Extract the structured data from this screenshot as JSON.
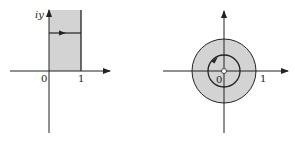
{
  "figures": [
    {
      "name": "strip-domain",
      "y_axis_label": "iy",
      "origin_label": "0",
      "tick_label": "1",
      "description": "Vertical half-strip 0 < Re z < 1, Im z > 0 shaded, with horizontal path arrow pointing right"
    },
    {
      "name": "annulus-image",
      "origin_label": "0",
      "tick_label": "1",
      "description": "Punctured unit disk shaded, with inner circle oriented counterclockwise and origin removed"
    }
  ],
  "colors": {
    "shade": "#d3d3d3",
    "stroke": "#222222",
    "background": "#ffffff"
  }
}
